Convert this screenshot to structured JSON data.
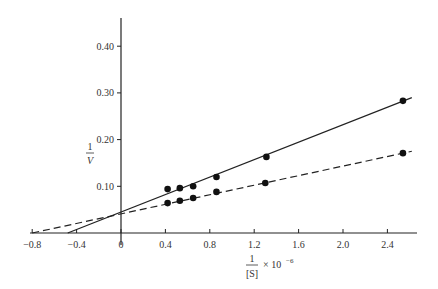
{
  "chart_data": {
    "type": "line",
    "title": "",
    "xlabel": "1/[S] × 10^-6",
    "ylabel": "1/V",
    "xlabel_parts": {
      "num": "1",
      "den": "[S]",
      "suffix": "× 10",
      "exp": "−6"
    },
    "ylabel_parts": {
      "num": "1",
      "den": "V"
    },
    "xlim": [
      -0.8,
      2.65
    ],
    "ylim": [
      0,
      0.45
    ],
    "grid": false,
    "legend": null,
    "x_ticks": [
      "−0.8",
      "−0.4",
      "0",
      "0.4",
      "0.8",
      "1.2",
      "1.6",
      "2.0",
      "2.4"
    ],
    "x_tick_values": [
      -0.8,
      -0.4,
      0,
      0.4,
      0.8,
      1.2,
      1.6,
      2.0,
      2.4
    ],
    "y_ticks": [
      "0.10",
      "0.20",
      "0.30",
      "0.40"
    ],
    "y_tick_values": [
      0.1,
      0.2,
      0.3,
      0.4
    ],
    "series": [
      {
        "name": "solid",
        "style": "solid",
        "x": [
          0.42,
          0.53,
          0.65,
          0.86,
          1.31,
          2.54
        ],
        "y": [
          0.094,
          0.096,
          0.1,
          0.12,
          0.163,
          0.283
        ],
        "fit_line": {
          "x_start": -0.48,
          "y_start": 0.0,
          "x_end": 2.62,
          "y_end": 0.29
        },
        "y_intercept": 0.045,
        "x_intercept": -0.48
      },
      {
        "name": "dashed",
        "style": "dashed",
        "x": [
          0.42,
          0.53,
          0.65,
          0.86,
          1.3,
          2.54
        ],
        "y": [
          0.064,
          0.069,
          0.075,
          0.088,
          0.107,
          0.171
        ],
        "fit_line": {
          "x_start": -0.8,
          "y_start": 0.0,
          "x_end": 2.62,
          "y_end": 0.175
        },
        "y_intercept": 0.041,
        "x_intercept": -0.8
      }
    ]
  }
}
